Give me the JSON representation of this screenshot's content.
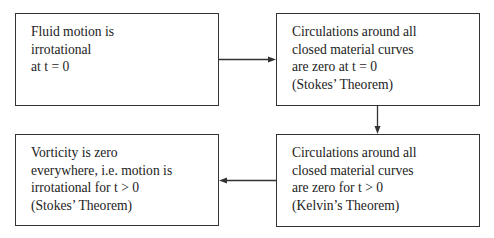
{
  "diagram": {
    "type": "flowchart",
    "nodes": [
      {
        "id": "box1",
        "lines": [
          "Fluid motion is",
          "irrotational",
          "at t = 0"
        ]
      },
      {
        "id": "box2",
        "lines": [
          "Circulations around all",
          "closed material curves",
          "are zero at t = 0",
          "(Stokes’ Theorem)"
        ]
      },
      {
        "id": "box3",
        "lines": [
          "Vorticity is zero",
          "everywhere, i.e. motion is",
          "irrotational for t > 0",
          "(Stokes’ Theorem)"
        ]
      },
      {
        "id": "box4",
        "lines": [
          "Circulations around all",
          "closed material curves",
          "are zero for t > 0",
          "(Kelvin’s Theorem)"
        ]
      }
    ],
    "edges": [
      {
        "from": "box1",
        "to": "box2",
        "direction": "right"
      },
      {
        "from": "box2",
        "to": "box4",
        "direction": "down"
      },
      {
        "from": "box4",
        "to": "box3",
        "direction": "left"
      }
    ],
    "colors": {
      "stroke": "#333333",
      "text": "#222222",
      "background": "#ffffff"
    }
  }
}
